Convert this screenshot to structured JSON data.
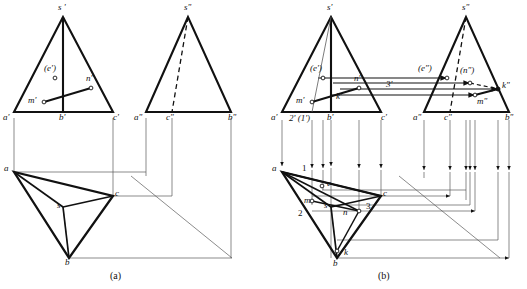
{
  "figure": {
    "title_visible": false,
    "captions": [
      {
        "text": "(a)",
        "x": 118,
        "y": 270
      },
      {
        "text": "(b)",
        "x": 385,
        "y": 270
      }
    ],
    "colors": {
      "ink": "#111111",
      "thin_line": "#4a4a4a",
      "paper": "#ffffff",
      "faint_top_text": "#b9b9b9"
    }
  },
  "top_cutoff_text": "— — — — — —",
  "panel_a": {
    "name": "projection-diagram-a",
    "caption": "(a)",
    "front_view": {
      "name": "front-view-a",
      "vertices": {
        "s_prime": [
          63,
          17
        ],
        "a_prime": [
          14,
          112
        ],
        "c_prime": [
          113,
          112
        ],
        "b_prime": [
          63,
          112
        ]
      },
      "labels": [
        {
          "text": "s '",
          "x": 58,
          "y": 3,
          "name": "label-s-prime"
        },
        {
          "text": "a'",
          "x": 3,
          "y": 113,
          "name": "label-a-prime"
        },
        {
          "text": "b'",
          "x": 59,
          "y": 113,
          "name": "label-b-prime"
        },
        {
          "text": "c'",
          "x": 113,
          "y": 113,
          "name": "label-c-prime"
        },
        {
          "text": "(e')",
          "x": 44,
          "y": 64,
          "name": "label-e-prime"
        },
        {
          "text": "m'",
          "x": 28,
          "y": 96,
          "name": "label-m-prime"
        },
        {
          "text": "n'",
          "x": 86,
          "y": 78,
          "name": "label-n-prime"
        }
      ],
      "points": [
        {
          "id": "e'",
          "x": 55,
          "y": 78,
          "style": "hollow"
        },
        {
          "id": "m'",
          "x": 44,
          "y": 102,
          "style": "hollow"
        },
        {
          "id": "n'",
          "x": 91,
          "y": 88,
          "style": "hollow"
        }
      ]
    },
    "side_view": {
      "name": "side-view-a",
      "vertices": {
        "s_dprime": [
          188,
          17
        ],
        "a_dprime": [
          146,
          112
        ],
        "b_dprime": [
          231,
          112
        ],
        "c_dprime": [
          172,
          112
        ]
      },
      "hidden_edge": {
        "from": [
          188,
          17
        ],
        "to": [
          172,
          112
        ],
        "style": "dashed"
      },
      "labels": [
        {
          "text": "s\"",
          "x": 184,
          "y": 3,
          "name": "label-s-dprime"
        },
        {
          "text": "a\"",
          "x": 135,
          "y": 113,
          "name": "label-a-dprime"
        },
        {
          "text": "c\"",
          "x": 166,
          "y": 113,
          "name": "label-c-dprime"
        },
        {
          "text": "b\"",
          "x": 231,
          "y": 113,
          "name": "label-b-dprime"
        }
      ]
    },
    "top_view": {
      "name": "top-view-a",
      "vertices": {
        "a": [
          14,
          172
        ],
        "b": [
          69,
          258
        ],
        "c": [
          113,
          196
        ],
        "s": [
          63,
          207
        ]
      },
      "labels": [
        {
          "text": "a",
          "x": 4,
          "y": 165,
          "name": "label-a"
        },
        {
          "text": "b",
          "x": 65,
          "y": 259,
          "name": "label-b"
        },
        {
          "text": "c",
          "x": 115,
          "y": 190,
          "name": "label-c"
        },
        {
          "text": "s",
          "x": 57,
          "y": 203,
          "name": "label-s"
        }
      ]
    },
    "construction": {
      "miter_line": {
        "from": [
          131,
          176
        ],
        "to": [
          232,
          258
        ]
      },
      "vertical_projectors": [
        {
          "x": 14,
          "y1": 120,
          "y2": 172
        },
        {
          "x": 113,
          "y1": 120,
          "y2": 196
        },
        {
          "x": 146,
          "y1": 120,
          "y2": 176
        },
        {
          "x": 172,
          "y1": 120,
          "y2": 196
        },
        {
          "x": 231,
          "y1": 120,
          "y2": 258
        }
      ],
      "horizontal_projectors": [
        {
          "y": 172,
          "x1": 14,
          "x2": 131
        },
        {
          "y": 196,
          "x1": 113,
          "x2": 172
        },
        {
          "y": 258,
          "x1": 69,
          "x2": 232
        }
      ]
    }
  },
  "panel_b": {
    "name": "projection-diagram-b",
    "caption": "(b)",
    "front_view": {
      "name": "front-view-b",
      "vertices": {
        "s_prime": [
          331,
          17
        ],
        "a_prime": [
          282,
          112
        ],
        "c_prime": [
          381,
          112
        ],
        "b_prime": [
          331,
          112
        ]
      },
      "labels": [
        {
          "text": "s'",
          "x": 327,
          "y": 3,
          "name": "label-s-prime-b"
        },
        {
          "text": "a'",
          "x": 271,
          "y": 113,
          "name": "label-a-prime-b"
        },
        {
          "text": "b'",
          "x": 327,
          "y": 113,
          "name": "label-b-prime-b"
        },
        {
          "text": "c'",
          "x": 381,
          "y": 113,
          "name": "label-c-prime-b"
        },
        {
          "text": "(e')",
          "x": 312,
          "y": 64,
          "name": "label-e-prime-b"
        },
        {
          "text": "m'",
          "x": 295,
          "y": 96,
          "name": "label-m-prime-b"
        },
        {
          "text": "k'",
          "x": 335,
          "y": 93,
          "name": "label-k-prime-b"
        },
        {
          "text": "n'",
          "x": 354,
          "y": 78,
          "name": "label-n-prime-b"
        },
        {
          "text": "3'",
          "x": 385,
          "y": 84,
          "name": "label-3-prime"
        },
        {
          "text": "2' (1')",
          "x": 289,
          "y": 114,
          "name": "label-2-1-prime"
        }
      ],
      "points": [
        {
          "id": "e'",
          "x": 323,
          "y": 78,
          "style": "hollow"
        },
        {
          "id": "m'",
          "x": 312,
          "y": 102,
          "style": "hollow"
        },
        {
          "id": "n'",
          "x": 359,
          "y": 88,
          "style": "hollow"
        }
      ]
    },
    "side_view": {
      "name": "side-view-b",
      "vertices": {
        "s_dprime": [
          466,
          17
        ],
        "a_dprime": [
          424,
          112
        ],
        "b_dprime": [
          509,
          112
        ],
        "c_dprime": [
          450,
          112
        ]
      },
      "hidden_edge": {
        "from": [
          466,
          17
        ],
        "to": [
          450,
          112
        ],
        "style": "dashed"
      },
      "labels": [
        {
          "text": "s\"",
          "x": 462,
          "y": 3,
          "name": "label-s-dprime-b"
        },
        {
          "text": "a\"",
          "x": 413,
          "y": 113,
          "name": "label-a-dprime-b"
        },
        {
          "text": "c\"",
          "x": 444,
          "y": 113,
          "name": "label-c-dprime-b"
        },
        {
          "text": "b\"",
          "x": 509,
          "y": 113,
          "name": "label-b-dprime-b"
        },
        {
          "text": "(e\")",
          "x": 420,
          "y": 64,
          "name": "label-e-dprime"
        },
        {
          "text": "(n\")",
          "x": 462,
          "y": 68,
          "name": "label-n-dprime"
        },
        {
          "text": "k\"",
          "x": 503,
          "y": 86,
          "name": "label-k-dprime"
        },
        {
          "text": "m\"",
          "x": 478,
          "y": 99,
          "name": "label-m-dprime"
        }
      ],
      "points": [
        {
          "id": "e\"",
          "x": 447,
          "y": 78,
          "style": "hollow"
        },
        {
          "id": "n\"",
          "x": 470,
          "y": 83,
          "style": "hollow"
        },
        {
          "id": "m\"",
          "x": 475,
          "y": 95,
          "style": "hollow"
        },
        {
          "id": "k\"",
          "x": 498,
          "y": 89,
          "style": "solid"
        }
      ]
    },
    "top_view": {
      "name": "top-view-b",
      "vertices": {
        "a": [
          282,
          172
        ],
        "b": [
          337,
          258
        ],
        "c": [
          381,
          196
        ],
        "s": [
          331,
          207
        ]
      },
      "labels": [
        {
          "text": "a",
          "x": 272,
          "y": 165,
          "name": "label-a-b"
        },
        {
          "text": "b",
          "x": 333,
          "y": 261,
          "name": "label-b-b"
        },
        {
          "text": "c",
          "x": 383,
          "y": 190,
          "name": "label-c-b"
        },
        {
          "text": "s",
          "x": 325,
          "y": 203,
          "name": "label-s-b"
        },
        {
          "text": "1",
          "x": 302,
          "y": 166,
          "name": "label-1"
        },
        {
          "text": "2",
          "x": 299,
          "y": 212,
          "name": "label-2"
        },
        {
          "text": "3",
          "x": 366,
          "y": 205,
          "name": "label-3"
        },
        {
          "text": "e",
          "x": 327,
          "y": 181,
          "name": "label-e"
        },
        {
          "text": "m",
          "x": 313,
          "y": 203,
          "name": "label-m"
        },
        {
          "text": "n",
          "x": 344,
          "y": 213,
          "name": "label-n"
        },
        {
          "text": "k",
          "x": 344,
          "y": 254,
          "name": "label-k"
        }
      ],
      "points": [
        {
          "id": "e",
          "x": 322,
          "y": 186,
          "style": "hollow"
        },
        {
          "id": "m",
          "x": 312,
          "y": 201,
          "style": "hollow"
        },
        {
          "id": "n",
          "x": 352,
          "y": 211,
          "style": "hollow"
        },
        {
          "id": "k",
          "x": 337,
          "y": 251,
          "style": "hollow"
        }
      ]
    },
    "transfer_arrows": {
      "name": "projection-transfer-arrows",
      "horizontal_between_views": [
        {
          "y": 78,
          "x1": 318,
          "x2": 447
        },
        {
          "y": 83,
          "x1": 333,
          "x2": 470
        },
        {
          "y": 89,
          "x1": 340,
          "x2": 498
        },
        {
          "y": 95,
          "x1": 330,
          "x2": 475
        }
      ],
      "down_arrows_x": [
        282,
        312,
        323,
        331,
        359,
        381,
        424,
        450,
        466,
        470,
        475,
        498,
        509
      ],
      "right_arrows_y": [
        196,
        211,
        258
      ]
    },
    "construction": {
      "miter_line": {
        "from": [
          399,
          176
        ],
        "to": [
          500,
          258
        ]
      }
    }
  }
}
